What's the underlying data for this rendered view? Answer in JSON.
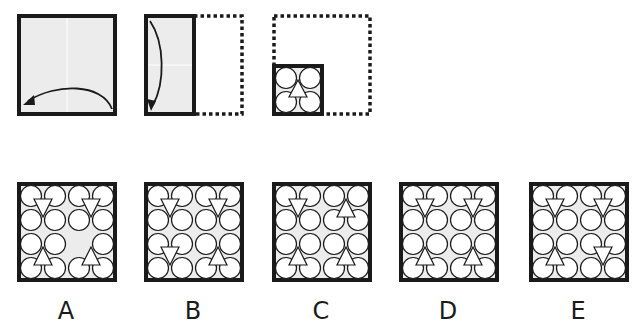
{
  "colors": {
    "paper_fill": "#ececec",
    "stroke": "#1a1a1a",
    "shape_fill": "#ffffff",
    "background": "#ffffff"
  },
  "fold_sequence": {
    "steps": [
      {
        "id": "step-1",
        "description": "Full square sheet, fold right half over to the left",
        "arrow": "curved-left"
      },
      {
        "id": "step-2",
        "description": "Half-width sheet (right half dotted), fold top down to bottom",
        "arrow": "curved-down"
      },
      {
        "id": "step-3",
        "description": "Quarter sheet at bottom-left with punched pattern; outline of original square dotted",
        "pattern": {
          "circles": 4,
          "triangle": "up"
        }
      }
    ]
  },
  "options": [
    {
      "label": "A",
      "quadrants": {
        "tl": "down",
        "tr": "down",
        "bl": "up",
        "br": "up"
      },
      "missing_circles": [
        [
          2,
          2
        ]
      ]
    },
    {
      "label": "B",
      "quadrants": {
        "tl": "down",
        "tr": "down",
        "bl": "down",
        "br": "up"
      },
      "missing_circles": []
    },
    {
      "label": "C",
      "quadrants": {
        "tl": "down",
        "tr": "up",
        "bl": "up",
        "br": "up"
      },
      "missing_circles": []
    },
    {
      "label": "D",
      "quadrants": {
        "tl": "down",
        "tr": "down",
        "bl": "up",
        "br": "up"
      },
      "missing_circles": []
    },
    {
      "label": "E",
      "quadrants": {
        "tl": "down",
        "tr": "down",
        "bl": "up",
        "br": "down"
      },
      "missing_circles": []
    }
  ]
}
